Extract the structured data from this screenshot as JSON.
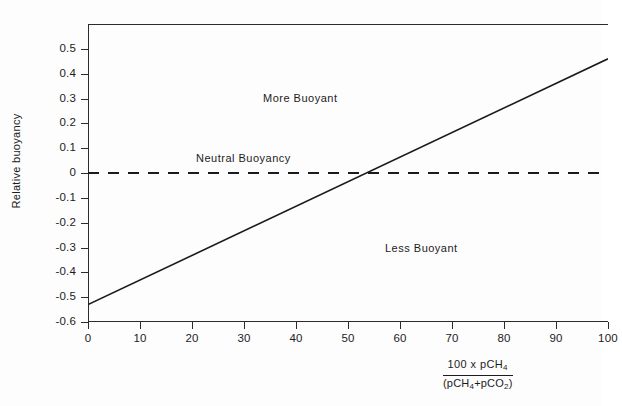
{
  "chart_data": {
    "type": "line",
    "title": "",
    "xlabel": "100 x pCH4 / (pCH4+pCO2)",
    "ylabel": "Relative buoyancy",
    "xlim": [
      0,
      100
    ],
    "ylim": [
      -0.6,
      0.6
    ],
    "grid": false,
    "legend_position": "none",
    "x_ticks": [
      0,
      10,
      20,
      30,
      40,
      50,
      60,
      70,
      80,
      90,
      100
    ],
    "x_tick_labels": [
      "0",
      "10",
      "20",
      "30",
      "40",
      "50",
      "60",
      "70",
      "80",
      "90",
      "100"
    ],
    "y_ticks": [
      0.5,
      0.4,
      0.3,
      0.2,
      0.1,
      0,
      -0.1,
      -0.2,
      -0.3,
      -0.4,
      -0.5,
      -0.6
    ],
    "y_tick_labels": [
      "0.5",
      "0.4",
      "0.3",
      "0.2",
      "0.1",
      "0",
      "-0.1",
      "-0.2",
      "-0.3",
      "-0.4",
      "-0.5",
      "-0.6"
    ],
    "series": [
      {
        "name": "Relative buoyancy vs methane fraction",
        "style": "solid",
        "x": [
          0,
          100
        ],
        "values": [
          -0.53,
          0.46
        ]
      },
      {
        "name": "Neutral buoyancy reference",
        "style": "dashed",
        "x": [
          0,
          100
        ],
        "values": [
          0,
          0
        ]
      }
    ],
    "annotations": [
      {
        "text": "More Buoyant",
        "x": 34,
        "y": 0.285
      },
      {
        "text": "Neutral  Buoyancy",
        "x": 21,
        "y": 0.055
      },
      {
        "text": "Less Buoyant",
        "x": 57,
        "y": -0.245
      }
    ],
    "crossing_point": {
      "x": 54,
      "y": 0
    }
  },
  "axes": {
    "y_title": "Relative buoyancy",
    "x_title": {
      "numerator": "100 x pCH",
      "numerator_sub": "4",
      "denominator_open": "(pCH",
      "denominator_sub1": "4",
      "denominator_mid": "+pCO",
      "denominator_sub2": "2",
      "denominator_close": ")"
    }
  },
  "colors": {
    "line": "#1a1a1a",
    "axis": "#2b2b2b",
    "background": "#fdfdfd",
    "text": "#1c1c1c"
  }
}
